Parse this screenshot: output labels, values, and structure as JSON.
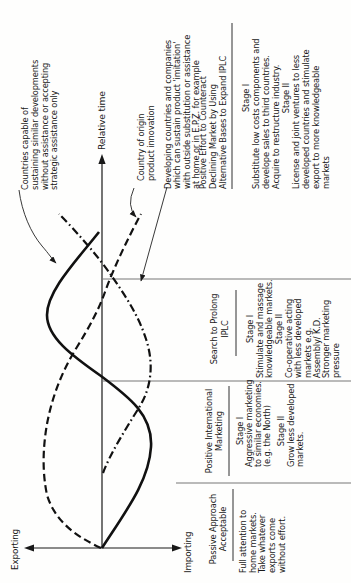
{
  "diagram": {
    "axes": {
      "x_label": "Relative time",
      "y_top_label": "Exporting",
      "y_bottom_label": "Importing"
    },
    "callouts": {
      "countries_capable": {
        "lines": [
          "Countries capable of",
          "sustaining similar developments",
          "without assistance or accepting",
          "strategic assistance only"
        ]
      },
      "country_origin": {
        "lines": [
          "Country of origin",
          "product innovation"
        ]
      },
      "developing": {
        "lines": [
          "Developing countries and companies",
          "which can sustain product 'imitation'",
          "with outside substitution or assistance",
          "at home or in E.P.Z. for example"
        ]
      }
    },
    "phases": [
      {
        "header": [
          "Passive Approach",
          "Acceptable"
        ],
        "body": [
          "Full attention to",
          "home markets.",
          "Take whatever",
          "exports come",
          "without effort."
        ]
      },
      {
        "header": [
          "Positive International",
          "Marketing"
        ],
        "stage1_label": "Stage I",
        "stage1": [
          "Aggressive marketing",
          "to similar economies.",
          "(e.g. the North)"
        ],
        "stage2_label": "Stage II",
        "stage2": [
          "Grow less developed",
          "markets."
        ]
      },
      {
        "header": [
          "Search to Prolong",
          "IPLC"
        ],
        "stage1_label": "Stage I",
        "stage1": [
          "Stimulate and massage",
          "knowledgeable markets."
        ],
        "stage2_label": "Stage II",
        "stage2": [
          "Co-operative acting",
          "with less developed",
          "markets e.g.",
          "Assembly/ K.D.",
          "Stronger marketing",
          "pressure"
        ]
      },
      {
        "header": [
          "Positive Effort to Counteract",
          "Declining Market by Using",
          "Alternative Bases to Expand IPLC"
        ],
        "stage1_label": "Stage I",
        "stage1": [
          "Substitute low costs components and",
          "develope sales to third countries.",
          "Acquire to restructure industry."
        ],
        "stage2_label": "Stage II",
        "stage2": [
          "License and joint ventures to less",
          "developed countries and stimulate",
          "export to more knowledgeable",
          "markets"
        ]
      }
    ]
  }
}
